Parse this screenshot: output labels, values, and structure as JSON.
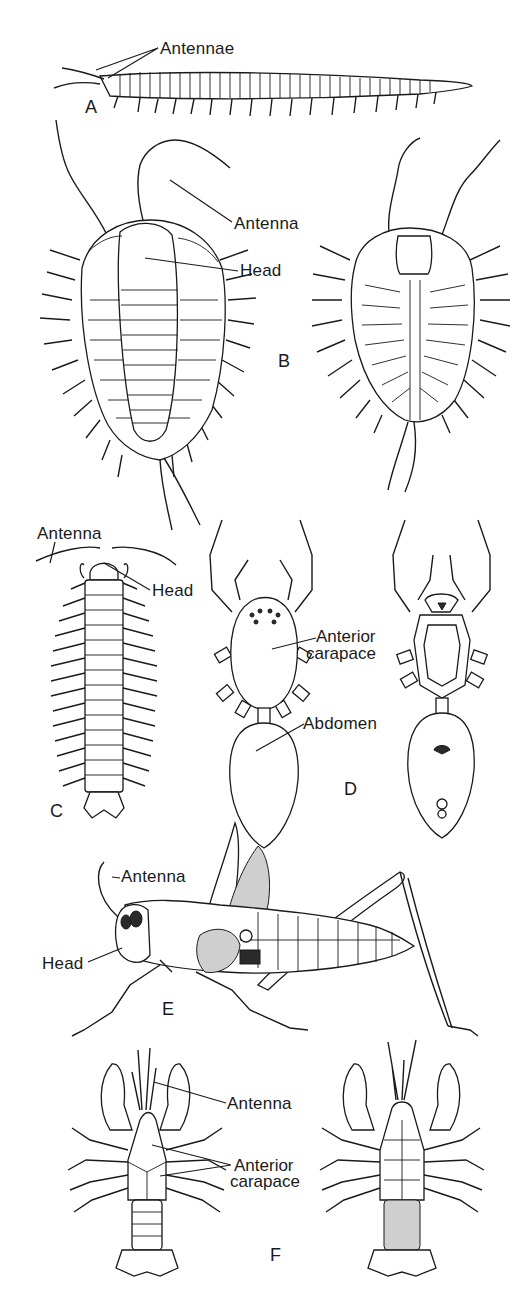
{
  "figure": {
    "panels": [
      {
        "id": "A",
        "letter": "A",
        "subject": "velvet-worm-like elongated arthropod (side view)",
        "labels": {
          "antennae": "Antennae"
        }
      },
      {
        "id": "B",
        "letter": "B",
        "subject": "trilobite (dorsal and ventral views)",
        "labels": {
          "antenna": "Antenna",
          "head": "Head"
        }
      },
      {
        "id": "C",
        "letter": "C",
        "subject": "millipede/centipede (dorsal view)",
        "labels": {
          "antenna": "Antenna",
          "head": "Head"
        }
      },
      {
        "id": "D",
        "letter": "D",
        "subject": "spider (dorsal and ventral views)",
        "labels": {
          "carapace_line1": "Anterior",
          "carapace_line2": "carapace",
          "abdomen": "Abdomen"
        }
      },
      {
        "id": "E",
        "letter": "E",
        "subject": "grasshopper (side view)",
        "labels": {
          "antenna": "Antenna",
          "head": "Head"
        }
      },
      {
        "id": "F",
        "letter": "F",
        "subject": "crayfish (dorsal and ventral views)",
        "labels": {
          "antenna": "Antenna",
          "carapace_line1": "Anterior",
          "carapace_line2": "carapace"
        }
      }
    ]
  }
}
